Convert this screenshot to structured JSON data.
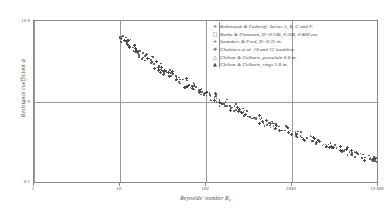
{
  "chart_data": {
    "type": "scatter",
    "title": "",
    "xlabel": "Reynolds' number Re",
    "ylabel": "Resistance coefficient ψ",
    "xscale": "log",
    "yscale": "log",
    "xlim": [
      1,
      10000
    ],
    "ylim": [
      0.1,
      10
    ],
    "grid": true,
    "xticks": [
      "1",
      "10",
      "100",
      "1000",
      "10 000"
    ],
    "xtick_values": [
      1,
      10,
      100,
      1000,
      10000
    ],
    "yticks": [
      "10·0",
      "1·0",
      "0·1"
    ],
    "ytick_values": [
      10,
      1,
      0.1
    ],
    "legend_position": "top-right",
    "series": [
      {
        "name": "Bohmstedt & Fedoroff, Series A, B, C and F.",
        "marker": "plus-and-filled",
        "points": [
          [
            10.4,
            6.2
          ],
          [
            11.2,
            5.9
          ],
          [
            12.0,
            5.5
          ],
          [
            13.1,
            5.1
          ],
          [
            14.5,
            4.7
          ],
          [
            16.0,
            4.3
          ],
          [
            17.8,
            4.0
          ],
          [
            19.5,
            3.7
          ],
          [
            21.5,
            3.4
          ],
          [
            24.0,
            3.1
          ],
          [
            26.5,
            2.9
          ],
          [
            29.0,
            2.7
          ],
          [
            32.0,
            2.5
          ],
          [
            36.0,
            2.3
          ],
          [
            40.0,
            2.1
          ],
          [
            45.0,
            1.95
          ]
        ]
      },
      {
        "name": "Burke & Plumman, D=0·108, 0·308, 0·400 cm.",
        "marker": "open-square",
        "points": [
          [
            52,
            1.85
          ],
          [
            58,
            1.72
          ],
          [
            65,
            1.6
          ],
          [
            72,
            1.5
          ],
          [
            80,
            1.42
          ],
          [
            90,
            1.34
          ],
          [
            100,
            1.26
          ],
          [
            112,
            1.19
          ],
          [
            125,
            1.12
          ],
          [
            140,
            1.05
          ],
          [
            158,
            0.99
          ],
          [
            175,
            0.94
          ]
        ]
      },
      {
        "name": "Saunders & Ford, D=0·25 in.",
        "marker": "plus",
        "points": [
          [
            200,
            0.88
          ],
          [
            230,
            0.83
          ],
          [
            260,
            0.78
          ],
          [
            300,
            0.73
          ],
          [
            340,
            0.69
          ],
          [
            390,
            0.65
          ],
          [
            450,
            0.61
          ],
          [
            520,
            0.57
          ],
          [
            600,
            0.54
          ],
          [
            690,
            0.5
          ],
          [
            800,
            0.47
          ]
        ]
      },
      {
        "name": "Chalmers et al. 10 and 12 leadshot.",
        "marker": "hash",
        "points": [
          [
            900,
            0.44
          ],
          [
            1050,
            0.42
          ],
          [
            1200,
            0.4
          ],
          [
            1400,
            0.38
          ],
          [
            1600,
            0.36
          ],
          [
            1850,
            0.34
          ],
          [
            2150,
            0.32
          ],
          [
            2500,
            0.3
          ]
        ]
      },
      {
        "name": "Chilton & Colburn, porcelain 0·8 in.",
        "marker": "open-triangle",
        "points": [
          [
            2900,
            0.285
          ],
          [
            3400,
            0.27
          ],
          [
            3900,
            0.26
          ],
          [
            4500,
            0.245
          ],
          [
            5200,
            0.235
          ],
          [
            6000,
            0.225
          ],
          [
            7000,
            0.215
          ],
          [
            8100,
            0.205
          ]
        ]
      },
      {
        "name": "Chilton & Colburn, rings 1·0 in.",
        "marker": "filled-triangle",
        "points": [
          [
            8800,
            0.2
          ],
          [
            9400,
            0.195
          ],
          [
            10000,
            0.19
          ]
        ]
      }
    ]
  },
  "axes": {
    "xlabel_main": "Reynolds' number R",
    "xlabel_sub": "e",
    "ylabel_main": "Resistance coefficient",
    "ylabel_symbol": "ψ",
    "x_ticks": [
      {
        "label": "1",
        "value": 1
      },
      {
        "label": "10",
        "value": 10
      },
      {
        "label": "100",
        "value": 100
      },
      {
        "label": "1000",
        "value": 1000
      },
      {
        "label": "10 000",
        "value": 10000
      }
    ],
    "y_ticks": [
      {
        "label": "10·0",
        "value": 10
      },
      {
        "label": "1·0",
        "value": 1
      },
      {
        "label": "0·1",
        "value": 0.1
      }
    ]
  },
  "legend": {
    "entries": [
      {
        "symbol": "+",
        "symbol_name": "plus-marker",
        "label": "Bohmstedt & Fedoroff, Series A, B, C and F."
      },
      {
        "symbol": "□",
        "symbol_name": "open-square-marker",
        "label": "Burke & Plumman, D=0·108, 0·308, 0·400 cm."
      },
      {
        "symbol": "+",
        "symbol_name": "plus-marker",
        "label": "Saunders & Ford, D=0·25 in."
      },
      {
        "symbol": "#",
        "symbol_name": "hash-marker",
        "label": "Chalmers et al. 10 and 12 leadshot."
      },
      {
        "symbol": "△",
        "symbol_name": "open-triangle-marker",
        "label": "Chilton & Colburn, porcelain 0·8 in."
      },
      {
        "symbol": "▲",
        "symbol_name": "filled-triangle-marker",
        "label": "Chilton & Colburn, rings 1·0 in."
      }
    ]
  },
  "colors": {
    "background": "#ffffff",
    "axis": "#8a8a8a",
    "grid": "#9a9a9a",
    "text": "#3a3a3a",
    "marker": "#4a4a4a"
  }
}
